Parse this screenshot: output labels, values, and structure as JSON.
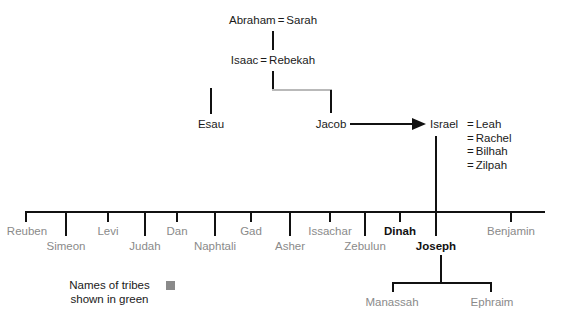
{
  "colors": {
    "tribe_text": "#8a8a8a",
    "person_text": "#1a1a1a",
    "line": "#111111",
    "faded_line": "#b9b9b9",
    "legend_swatch": "#8a8a8a"
  },
  "generations": {
    "abraham": {
      "husband": "Abraham",
      "equals": "=",
      "wife": "Sarah"
    },
    "isaac": {
      "husband": "Isaac",
      "equals": "=",
      "wife": "Rebekah"
    },
    "esau": {
      "label": "Esau"
    },
    "jacob": {
      "label": "Jacob"
    },
    "israel": {
      "husband": "Israel",
      "equals": "=",
      "wives": [
        "Leah",
        "Rachel",
        "Bilhah",
        "Zilpah"
      ]
    }
  },
  "children": {
    "upper_row": [
      {
        "label": "Reuben",
        "is_tribe": true,
        "x": 27
      },
      {
        "label": "Levi",
        "is_tribe": true,
        "x": 108
      },
      {
        "label": "Dan",
        "is_tribe": true,
        "x": 177
      },
      {
        "label": "Gad",
        "is_tribe": true,
        "x": 251
      },
      {
        "label": "Issachar",
        "is_tribe": true,
        "x": 330
      },
      {
        "label": "Dinah",
        "is_tribe": false,
        "x": 400
      },
      {
        "label": "Benjamin",
        "is_tribe": true,
        "x": 511
      }
    ],
    "lower_row": [
      {
        "label": "Simeon",
        "is_tribe": true,
        "x": 66
      },
      {
        "label": "Judah",
        "is_tribe": true,
        "x": 145
      },
      {
        "label": "Naphtali",
        "is_tribe": true,
        "x": 215
      },
      {
        "label": "Asher",
        "is_tribe": true,
        "x": 290
      },
      {
        "label": "Zebulun",
        "is_tribe": true,
        "x": 365
      },
      {
        "label": "Joseph",
        "is_tribe": false,
        "x": 436
      }
    ]
  },
  "grandchildren": [
    {
      "label": "Manassah",
      "is_tribe": true,
      "x": 392
    },
    {
      "label": "Ephraim",
      "is_tribe": true,
      "x": 492
    }
  ],
  "legend": {
    "line1": "Names of tribes",
    "line2": "shown in green",
    "swatch_color": "#8a8a8a"
  }
}
